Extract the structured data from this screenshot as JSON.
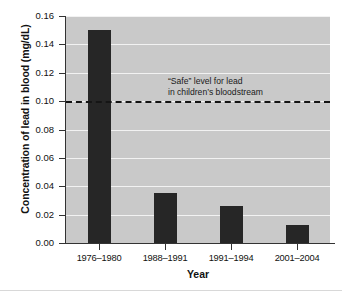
{
  "chart_data": {
    "type": "bar",
    "title": "",
    "xlabel": "Year",
    "ylabel": "Concentration of lead in blood (mg/dL)",
    "categories": [
      "1976–1980",
      "1988–1991",
      "1991–1994",
      "2001–2004"
    ],
    "values": [
      0.15,
      0.035,
      0.026,
      0.013
    ],
    "ylim": [
      0.0,
      0.16
    ],
    "yticks": [
      "0.00",
      "0.02",
      "0.04",
      "0.06",
      "0.08",
      "0.10",
      "0.12",
      "0.14",
      "0.16"
    ],
    "ytick_values": [
      0.0,
      0.02,
      0.04,
      0.06,
      0.08,
      0.1,
      0.12,
      0.14,
      0.16
    ],
    "grid": true,
    "legend": "none",
    "bar_color": "#262626",
    "plot_background": "#c9c9c9",
    "gridline_color": "#f2f2f2",
    "annotations": [
      {
        "name": "safe-level-threshold",
        "type": "horizontal-dashed-line",
        "value": 0.1,
        "color": "#151515",
        "label_line1": "“Safe” level for lead",
        "label_line2": "in children’s bloodstream"
      }
    ]
  }
}
